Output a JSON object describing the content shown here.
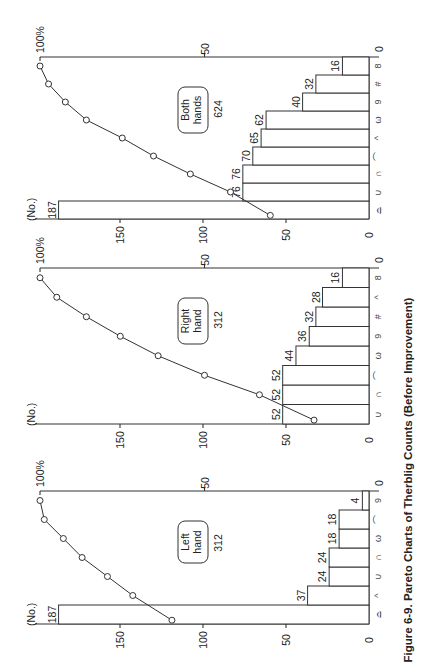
{
  "caption": "Figure 6-9.  Pareto Charts of Therblig Counts (Before Improvement)",
  "chart_data": [
    {
      "type": "bar",
      "title": "Left hand",
      "total": 312,
      "ylabel": "(No.)",
      "y2label": "100%",
      "yticks": [
        0,
        50,
        100,
        150
      ],
      "y2ticks": [
        "0",
        "50",
        "100%"
      ],
      "categories": [
        "⌓",
        "^",
        "∪",
        "∩",
        "ω",
        "⌒",
        "9"
      ],
      "values": [
        187,
        37,
        24,
        24,
        18,
        18,
        4
      ],
      "cumulative_pct": [
        59.9,
        71.8,
        79.5,
        87.2,
        92.9,
        98.7,
        100.0
      ],
      "layout": {
        "axis_y": 624,
        "top_y": 491
      }
    },
    {
      "type": "bar",
      "title": "Right hand",
      "total": 312,
      "ylabel": "(No.)",
      "y2label": "100%",
      "yticks": [
        0,
        50,
        100,
        150
      ],
      "y2ticks": [
        "0",
        "50",
        "100%"
      ],
      "categories": [
        "∪",
        "∩",
        "⌒",
        "ω",
        "9",
        "#",
        "^",
        "8"
      ],
      "values": [
        52,
        52,
        52,
        44,
        36,
        32,
        28,
        16
      ],
      "cumulative_pct": [
        16.7,
        33.3,
        50.0,
        64.1,
        75.6,
        85.9,
        94.9,
        100.0
      ],
      "layout": {
        "axis_y": 424,
        "top_y": 268
      }
    },
    {
      "type": "bar",
      "title": "Both hands",
      "total": 624,
      "ylabel": "(No.)",
      "y2label": "100%",
      "yticks": [
        0,
        50,
        100,
        150
      ],
      "y2ticks": [
        "0",
        "50",
        "100%"
      ],
      "categories": [
        "⌓",
        "∪",
        "∩",
        "⌒",
        "^",
        "ω",
        "9",
        "#",
        "8"
      ],
      "values": [
        187,
        76,
        76,
        70,
        65,
        62,
        40,
        32,
        16
      ],
      "cumulative_pct": [
        30.0,
        42.1,
        54.3,
        65.5,
        75.0,
        85.9,
        92.3,
        97.4,
        100.0
      ],
      "layout": {
        "axis_y": 219,
        "top_y": 57
      }
    }
  ]
}
